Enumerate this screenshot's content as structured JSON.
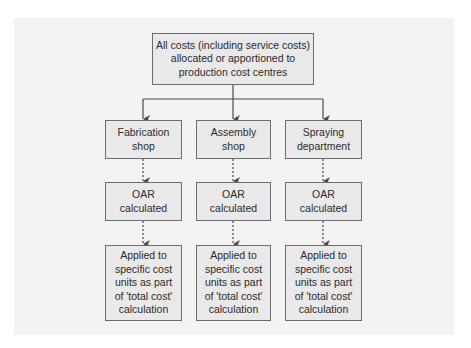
{
  "diagram": {
    "type": "flowchart",
    "colors": {
      "panel_background": "#f3f3f3",
      "box_fill": "#e9e9e9",
      "box_border": "#6d6d6d",
      "connector": "#4a4a4a"
    },
    "root": {
      "label": "All costs (including service costs)\nallocated or apportioned to\nproduction cost centres"
    },
    "columns": [
      {
        "centre": {
          "label": "Fabrication\nshop"
        },
        "oar": {
          "label": "OAR\ncalculated"
        },
        "applied": {
          "label": "Applied to\nspecific cost\nunits as part\nof 'total cost'\ncalculation"
        }
      },
      {
        "centre": {
          "label": "Assembly\nshop"
        },
        "oar": {
          "label": "OAR\ncalculated"
        },
        "applied": {
          "label": "Applied to\nspecific cost\nunits as part\nof 'total cost'\ncalculation"
        }
      },
      {
        "centre": {
          "label": "Spraying\ndepartment"
        },
        "oar": {
          "label": "OAR\ncalculated"
        },
        "applied": {
          "label": "Applied to\nspecific cost\nunits as part\nof 'total cost'\ncalculation"
        }
      }
    ],
    "edges": [
      {
        "from": "root",
        "to": "columns.0.centre",
        "style": "solid"
      },
      {
        "from": "root",
        "to": "columns.1.centre",
        "style": "solid"
      },
      {
        "from": "root",
        "to": "columns.2.centre",
        "style": "solid"
      },
      {
        "from": "columns.0.centre",
        "to": "columns.0.oar",
        "style": "dashed"
      },
      {
        "from": "columns.1.centre",
        "to": "columns.1.oar",
        "style": "dashed"
      },
      {
        "from": "columns.2.centre",
        "to": "columns.2.oar",
        "style": "dashed"
      },
      {
        "from": "columns.0.oar",
        "to": "columns.0.applied",
        "style": "dashed"
      },
      {
        "from": "columns.1.oar",
        "to": "columns.1.applied",
        "style": "dashed"
      },
      {
        "from": "columns.2.oar",
        "to": "columns.2.applied",
        "style": "dashed"
      }
    ]
  }
}
